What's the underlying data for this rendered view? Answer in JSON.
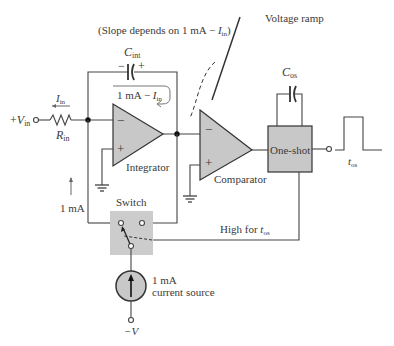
{
  "diagram": {
    "type": "circuit-schematic",
    "annotations": {
      "ramp_line1": "Voltage ramp",
      "ramp_line2_prefix": "(Slope depends on 1 mA  −  ",
      "ramp_line2_var": "I",
      "ramp_line2_sub": "in",
      "ramp_line2_suffix": ")",
      "feedback_current_prefix": "1 mA  −  ",
      "feedback_current_var": "I",
      "feedback_current_sub": "in",
      "input_current_var": "I",
      "input_current_sub": "in",
      "one_ma_label": "1 mA",
      "high_for_prefix": "High for ",
      "high_for_var": "t",
      "high_for_sub": "os"
    },
    "components": {
      "c_int": {
        "var": "C",
        "sub": "int",
        "minus": "−",
        "plus": "+"
      },
      "c_os": {
        "var": "C",
        "sub": "os"
      },
      "r_in": {
        "var": "R",
        "sub": "in"
      },
      "vin": {
        "prefix": "+",
        "var": "V",
        "sub": "in"
      },
      "integrator": {
        "label": "Integrator",
        "minus": "−",
        "plus": "+"
      },
      "comparator": {
        "label": "Comparator",
        "minus": "−",
        "plus": "+"
      },
      "one_shot": {
        "label": "One-shot"
      },
      "switch": {
        "label": "Switch"
      },
      "current_source": {
        "line1": "1 mA",
        "line2": "current source"
      },
      "neg_supply": {
        "label": "−V"
      },
      "output_pulse": {
        "var": "t",
        "sub": "os"
      }
    },
    "colors": {
      "block_fill": "#c8c8c8",
      "wire": "#444444",
      "text": "#3a3a3a"
    }
  }
}
